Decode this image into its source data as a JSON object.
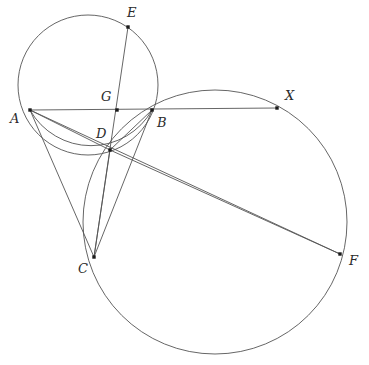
{
  "figure": {
    "width": 369,
    "height": 365,
    "background_color": "#ffffff",
    "stroke_color": "#555555",
    "point_color": "#1a1a1a",
    "label_color": "#2b2b2b"
  },
  "points": [
    {
      "id": "A",
      "label": "A",
      "x": 30,
      "y": 110,
      "label_x": 10,
      "label_y": 112,
      "dot": true
    },
    {
      "id": "B",
      "label": "B",
      "x": 152,
      "y": 110,
      "label_x": 157,
      "label_y": 116,
      "dot": true
    },
    {
      "id": "C",
      "label": "C",
      "x": 94,
      "y": 257,
      "label_x": 78,
      "label_y": 262,
      "dot": true
    },
    {
      "id": "D",
      "label": "D",
      "x": 110,
      "y": 150,
      "label_x": 96,
      "label_y": 127,
      "dot": true
    },
    {
      "id": "E",
      "label": "E",
      "x": 128,
      "y": 27,
      "label_x": 127,
      "label_y": 6,
      "dot": true
    },
    {
      "id": "F",
      "label": "F",
      "x": 340,
      "y": 254,
      "label_x": 349,
      "label_y": 254,
      "dot": true
    },
    {
      "id": "G",
      "label": "G",
      "x": 117,
      "y": 110,
      "label_x": 101,
      "label_y": 90,
      "dot": true
    },
    {
      "id": "X",
      "label": "X",
      "x": 277,
      "y": 108,
      "label_x": 285,
      "label_y": 89,
      "dot": true
    }
  ],
  "circles": [
    {
      "id": "circle-ABDE",
      "name": "small-circle",
      "cx": 88,
      "cy": 85,
      "r": 70,
      "through": [
        "A",
        "E",
        "B",
        "D"
      ]
    },
    {
      "id": "circle-BXFC",
      "name": "large-circle",
      "cx": 215,
      "cy": 222,
      "r": 132,
      "through": [
        "B",
        "X",
        "F",
        "C"
      ]
    }
  ],
  "segments": [
    {
      "id": "seg-AX",
      "from": "A",
      "to": "X",
      "name": "segment-a-x"
    },
    {
      "id": "seg-AD",
      "from": "A",
      "to": "D",
      "name": "segment-a-d"
    },
    {
      "id": "seg-AC",
      "from": "A",
      "to": "C",
      "name": "segment-a-c"
    },
    {
      "id": "seg-AF",
      "from": "A",
      "to": "F",
      "name": "segment-a-f"
    },
    {
      "id": "seg-EC",
      "from": "E",
      "to": "C",
      "name": "segment-e-c"
    },
    {
      "id": "seg-BC",
      "from": "B",
      "to": "C",
      "name": "segment-b-c"
    },
    {
      "id": "seg-BD",
      "from": "B",
      "to": "D",
      "name": "segment-b-d"
    },
    {
      "id": "seg-DC",
      "from": "D",
      "to": "C",
      "name": "segment-d-c"
    },
    {
      "id": "seg-DF",
      "from": "D",
      "to": "F",
      "name": "segment-d-f"
    }
  ],
  "arcs": [
    {
      "id": "arc-ADB",
      "name": "arc-a-d-b",
      "cx": 88,
      "cy": 85,
      "r": 70,
      "start": "A",
      "end": "B",
      "note": "lower arc of small circle through D"
    }
  ]
}
